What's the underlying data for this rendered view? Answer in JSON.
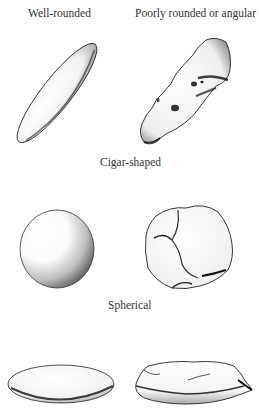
{
  "figure": {
    "column_headers": {
      "left": "Well-rounded",
      "right": "Poorly rounded or angular"
    },
    "rows": [
      {
        "label": "Cigar-shaped",
        "left_shape": "well-rounded-cigar-pebble",
        "right_shape": "angular-elongated-pebble"
      },
      {
        "label": "Spherical",
        "left_shape": "well-rounded-sphere-pebble",
        "right_shape": "angular-blocky-pebble"
      },
      {
        "label": "",
        "left_shape": "well-rounded-disc-pebble",
        "right_shape": "angular-flat-slab-pebble"
      }
    ]
  },
  "colors": {
    "ink": "#111111",
    "text": "#333333",
    "background": "#ffffff"
  }
}
